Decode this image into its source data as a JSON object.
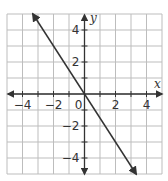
{
  "chart_data": {
    "type": "line",
    "title": "",
    "xlabel": "x",
    "ylabel": "y",
    "xlim": [
      -5,
      5
    ],
    "ylim": [
      -5,
      5
    ],
    "grid": true,
    "grid_step": 1,
    "x_ticks": [
      -4,
      -2,
      0,
      2,
      4
    ],
    "y_ticks": [
      -4,
      -2,
      2,
      4
    ],
    "x_tick_labels": [
      "−4",
      "−2",
      "0",
      "2",
      "4"
    ],
    "y_tick_labels": [
      "−4",
      "−2",
      "2",
      "4"
    ],
    "series": [
      {
        "name": "line",
        "equation": "y = -1.5x",
        "slope": -1.5,
        "intercept": 0,
        "x": [
          -3.33,
          0,
          3.33
        ],
        "y": [
          5,
          0,
          -5
        ],
        "arrows_both_ends": true
      }
    ],
    "colors": {
      "grid": "#bdbdbd",
      "axis": "#333333",
      "line": "#333333"
    }
  }
}
